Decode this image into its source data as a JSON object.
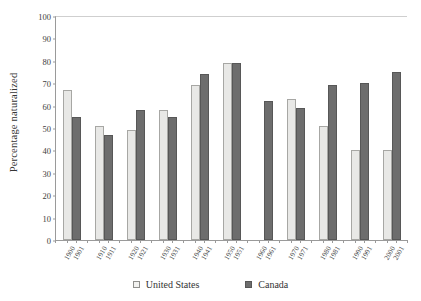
{
  "chart_data": {
    "type": "bar",
    "title": "",
    "xlabel": "",
    "ylabel": "Percentage naturalized",
    "ylim": [
      0,
      100
    ],
    "yticks": [
      0,
      10,
      20,
      30,
      40,
      50,
      60,
      70,
      80,
      90,
      100
    ],
    "grid": false,
    "legend_position": "bottom-center",
    "categories": [
      "1900",
      "1901",
      "1910",
      "1911",
      "1920",
      "1921",
      "1930",
      "1931",
      "1940",
      "1941",
      "1950",
      "1951",
      "1960",
      "1961",
      "1970",
      "1971",
      "1980",
      "1981",
      "1990",
      "1991",
      "2000",
      "2001"
    ],
    "series": [
      {
        "name": "United States",
        "color": "#e8e8e6",
        "points": [
          {
            "category": "1900",
            "value": 67
          },
          {
            "category": "1910",
            "value": 51
          },
          {
            "category": "1920",
            "value": 49
          },
          {
            "category": "1930",
            "value": 58
          },
          {
            "category": "1940",
            "value": 69
          },
          {
            "category": "1950",
            "value": 79
          },
          {
            "category": "1960",
            "value": null
          },
          {
            "category": "1970",
            "value": 63
          },
          {
            "category": "1980",
            "value": 51
          },
          {
            "category": "1990",
            "value": 40
          },
          {
            "category": "2000",
            "value": 40
          }
        ]
      },
      {
        "name": "Canada",
        "color": "#6d6d6d",
        "points": [
          {
            "category": "1901",
            "value": 55
          },
          {
            "category": "1911",
            "value": 47
          },
          {
            "category": "1921",
            "value": 58
          },
          {
            "category": "1931",
            "value": 55
          },
          {
            "category": "1941",
            "value": 74
          },
          {
            "category": "1951",
            "value": 79
          },
          {
            "category": "1961",
            "value": 62
          },
          {
            "category": "1971",
            "value": 59
          },
          {
            "category": "1981",
            "value": 69
          },
          {
            "category": "1991",
            "value": 70
          },
          {
            "category": "2001",
            "value": 75
          }
        ]
      }
    ]
  },
  "legend": {
    "items": [
      {
        "label": "United States",
        "swatch": "us"
      },
      {
        "label": "Canada",
        "swatch": "ca"
      }
    ]
  }
}
